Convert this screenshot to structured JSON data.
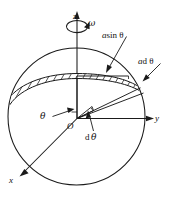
{
  "figure": {
    "background_color": "#ffffff",
    "stroke_color": "#1a1a1a",
    "axes": {
      "z_label": "z",
      "y_label": "y",
      "x_label": "x",
      "origin_label": "O"
    },
    "labels": {
      "omega": "ω",
      "a_sin_theta_a": "a",
      "a_sin_theta_rest": "sin θ",
      "a_d_theta_a": "a",
      "a_d_theta_rest": "d θ",
      "theta": "θ",
      "d_theta_d": "d",
      "d_theta_sym": "θ"
    },
    "geometry": {
      "sphere_center_x": 76.5,
      "sphere_center_y": 116.5,
      "sphere_radius": 68.5,
      "band_hatch_count": 22,
      "rotation_direction": "counterclockwise about z"
    }
  }
}
